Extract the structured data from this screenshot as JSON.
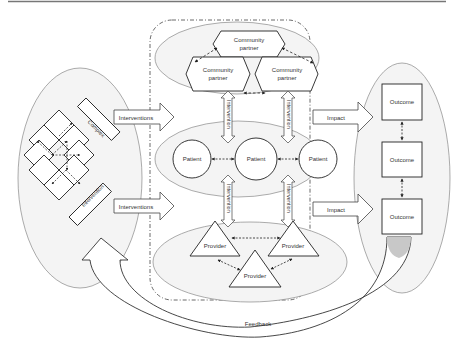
{
  "diagram": {
    "left_system": {
      "labels": {
        "complex": "Complex",
        "intervention": "Intervention"
      }
    },
    "inputs": [
      {
        "label": "Interventions"
      },
      {
        "label": "Interventions"
      }
    ],
    "center": {
      "community_partners": [
        "Community partner",
        "Community partner",
        "Community partner"
      ],
      "community_lines": [
        [
          "Community",
          "partner"
        ],
        [
          "Community",
          "partner"
        ],
        [
          "Community",
          "partner"
        ]
      ],
      "patients": [
        "Patient",
        "Patient",
        "Patient"
      ],
      "providers": [
        "Provider",
        "Provider",
        "Provider"
      ],
      "vertical_arrows": [
        "Intervention",
        "Intervention",
        "Intervention",
        "Intervention"
      ]
    },
    "impacts": [
      {
        "label": "Impact"
      },
      {
        "label": "Impact"
      }
    ],
    "outcomes": [
      "Outcome",
      "Outcome",
      "Outcome"
    ],
    "feedback": {
      "label": "Feedback"
    }
  }
}
